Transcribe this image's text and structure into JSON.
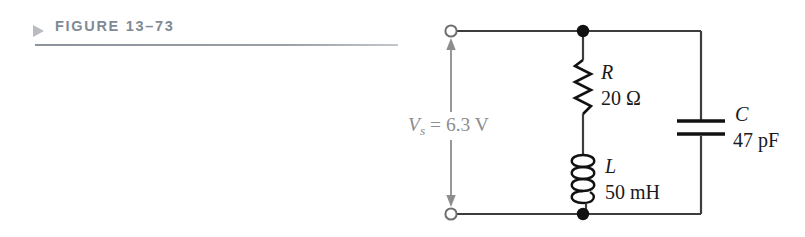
{
  "figure": {
    "marker_icon": "triangle-right-icon",
    "label": "FIGURE 13–73",
    "label_color": "#7f8a96",
    "rule_color": "#9aa0a6"
  },
  "circuit": {
    "type": "series-parallel RLC resonant circuit",
    "wire_color": "#3d3d3d",
    "source": {
      "name": "voltage-source",
      "label": "V",
      "subscript": "s",
      "equals": " = 6.3 V",
      "full_label": "Vs = 6.3 V",
      "value": "6.3",
      "unit": "V",
      "color": "#8d8d8d",
      "arrow": "double-headed-vertical-arrow"
    },
    "terminals": [
      {
        "name": "top-terminal",
        "style": "open-circle"
      },
      {
        "name": "bottom-terminal",
        "style": "open-circle"
      }
    ],
    "nodes": [
      {
        "name": "top-junction-node",
        "style": "filled-dot"
      },
      {
        "name": "bottom-junction-node",
        "style": "filled-dot"
      }
    ],
    "components": [
      {
        "id": "resistor",
        "symbol": "zigzag",
        "designator": "R",
        "value": "20",
        "unit": "Ω",
        "value_label": "20 Ω"
      },
      {
        "id": "inductor",
        "symbol": "coil",
        "designator": "L",
        "value": "50",
        "unit": "mH",
        "value_label": "50 mH"
      },
      {
        "id": "capacitor",
        "symbol": "parallel-plates",
        "designator": "C",
        "value": "47",
        "unit": "pF",
        "value_label": "47 pF"
      }
    ]
  }
}
